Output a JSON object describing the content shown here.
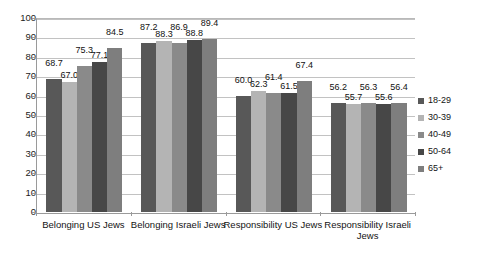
{
  "chart_data": {
    "type": "bar",
    "title": "",
    "subtitle": "",
    "xlabel": "",
    "ylabel": "",
    "ylim": [
      0,
      100
    ],
    "ytick_step": 10,
    "yticks": [
      100,
      90,
      80,
      70,
      60,
      50,
      40,
      30,
      20,
      10,
      0
    ],
    "grid": true,
    "legend_position": "right",
    "categories": [
      "Belonging US Jews",
      "Belonging Israeli Jews",
      "Responsibility US Jews",
      "Responsibility Israeli Jews"
    ],
    "series": [
      {
        "name": "18-29",
        "color": "#585858",
        "values": [
          68.7,
          87.2,
          60.0,
          56.2
        ]
      },
      {
        "name": "30-39",
        "color": "#b4b4b4",
        "values": [
          67.0,
          88.3,
          62.3,
          55.7
        ]
      },
      {
        "name": "40-49",
        "color": "#8a8a8a",
        "values": [
          75.3,
          86.9,
          61.4,
          56.3
        ]
      },
      {
        "name": "50-64",
        "color": "#474747",
        "values": [
          77.1,
          88.8,
          61.5,
          55.6
        ]
      },
      {
        "name": "65+",
        "color": "#7e7e7e",
        "values": [
          84.5,
          89.4,
          67.4,
          56.4
        ]
      }
    ],
    "data_labels": [
      [
        "68.7",
        "67.0",
        "75.3",
        "77.1",
        "84.5"
      ],
      [
        "87.2",
        "88.3",
        "86.9",
        "88.8",
        "89.4"
      ],
      [
        "60.0",
        "62.3",
        "61.4",
        "61.5",
        "67.4"
      ],
      [
        "56.2",
        "55.7",
        "56.3",
        "55.6",
        "56.4"
      ]
    ]
  },
  "legend": {
    "items": [
      {
        "label": "18-29"
      },
      {
        "label": "30-39"
      },
      {
        "label": "40-49"
      },
      {
        "label": "50-64"
      },
      {
        "label": "65+"
      }
    ]
  }
}
